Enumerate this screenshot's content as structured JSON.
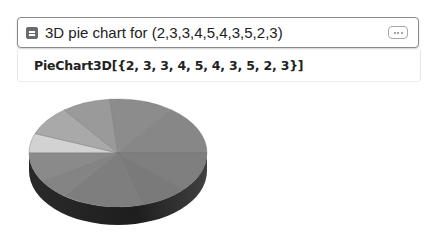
{
  "input": {
    "query": "3D pie chart for (2,3,3,4,5,4,3,5,2,3)",
    "icon": "input-square-icon",
    "more_button_icon": "ellipsis-icon"
  },
  "output": {
    "code": "PieChart3D[{2, 3, 3, 4, 5, 4, 3, 5, 2, 3}]"
  },
  "chart_data": {
    "type": "pie",
    "subtype": "3d",
    "values": [
      2,
      3,
      3,
      4,
      5,
      4,
      3,
      5,
      2,
      3
    ],
    "title": "",
    "legend": false,
    "colors": "grayscale"
  }
}
